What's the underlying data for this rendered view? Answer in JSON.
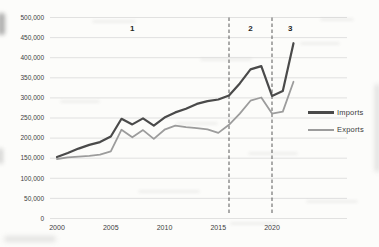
{
  "chart_data": {
    "type": "line",
    "title": "",
    "xlabel": "",
    "ylabel": "",
    "x": [
      2000,
      2001,
      2002,
      2003,
      2004,
      2005,
      2006,
      2007,
      2008,
      2009,
      2010,
      2011,
      2012,
      2013,
      2014,
      2015,
      2016,
      2017,
      2018,
      2019,
      2020,
      2021,
      2022
    ],
    "series": [
      {
        "name": "Imports",
        "color": "#4a4a4a",
        "width": 2.2,
        "values": [
          153000,
          163000,
          174000,
          183000,
          190000,
          204000,
          248000,
          234000,
          249000,
          231000,
          251000,
          264000,
          273000,
          285000,
          292000,
          296000,
          306000,
          336000,
          371000,
          379000,
          305000,
          317000,
          436000
        ]
      },
      {
        "name": "Exports",
        "color": "#9c9c9c",
        "width": 1.8,
        "values": [
          148000,
          152000,
          154000,
          156000,
          159000,
          167000,
          221000,
          202000,
          220000,
          198000,
          221000,
          231000,
          227000,
          225000,
          222000,
          213000,
          233000,
          261000,
          293000,
          301000,
          261000,
          266000,
          340000
        ]
      }
    ],
    "xaxis": {
      "range": [
        2000,
        2022
      ],
      "tick_years": [
        2000,
        2005,
        2010,
        2015,
        2020
      ],
      "tick_labels": [
        "2000",
        "2005",
        "2010",
        "2015",
        "2020"
      ]
    },
    "yaxis": {
      "min": 0,
      "max": 500000,
      "step": 50000,
      "tick_labels": [
        "0",
        "50,000",
        "100,000",
        "150,000",
        "200,000",
        "250,000",
        "300,000",
        "350,000",
        "400,000",
        "450,000",
        "500,000"
      ]
    },
    "grid": true,
    "dividers": [
      {
        "year": 2016,
        "style": "dashed"
      },
      {
        "year": 2020,
        "style": "dashed"
      }
    ],
    "annotations": [
      {
        "text": "1",
        "year": 2007
      },
      {
        "text": "2",
        "year": 2018
      },
      {
        "text": "3",
        "year": 2021.7
      }
    ],
    "legend": {
      "position": "right"
    },
    "colors": {
      "grid": "#d9d9d9",
      "divider": "#595959",
      "tick_text": "#404040",
      "annotation_text": "#262626"
    }
  }
}
